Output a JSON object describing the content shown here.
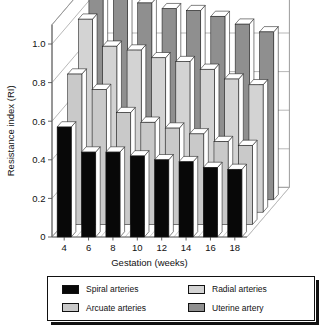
{
  "chart_data": {
    "type": "bar",
    "subtype": "3d-grouped-bar",
    "title": "",
    "xlabel": "Gestation (weeks)",
    "ylabel": "Resistance index (RI)",
    "categories": [
      "4",
      "6",
      "8",
      "10",
      "12",
      "14",
      "16",
      "18"
    ],
    "ylim": [
      0,
      1.1
    ],
    "yticks": [
      "0",
      "0.2",
      "0.4",
      "0.6",
      "0.8",
      "1.0"
    ],
    "ytick_values": [
      0,
      0.2,
      0.4,
      0.6,
      0.8,
      1.0
    ],
    "grid": true,
    "legend_position": "bottom",
    "series": [
      {
        "name": "Spiral arteries",
        "color": "#080808",
        "values": [
          0.57,
          0.44,
          0.44,
          0.42,
          0.4,
          0.39,
          0.36,
          0.35
        ]
      },
      {
        "name": "Arcuate arteries",
        "color": "#c9c9c9",
        "values": [
          0.78,
          0.7,
          0.58,
          0.53,
          0.5,
          0.47,
          0.43,
          0.41
        ]
      },
      {
        "name": "Radial arteries",
        "color": "#d3d3d3",
        "values": [
          1.0,
          0.86,
          0.84,
          0.8,
          0.78,
          0.74,
          0.69,
          0.66
        ]
      },
      {
        "name": "Uterine artery",
        "color": "#8f8f8f",
        "values": [
          1.09,
          1.06,
          1.02,
          0.99,
          0.98,
          0.95,
          0.91,
          0.87
        ]
      }
    ]
  },
  "legend": {
    "items": [
      {
        "label": "Spiral arteries",
        "color": "#080808"
      },
      {
        "label": "Radial arteries",
        "color": "#d3d3d3"
      },
      {
        "label": "Arcuate arteries",
        "color": "#c9c9c9"
      },
      {
        "label": "Uterine artery",
        "color": "#8f8f8f"
      }
    ]
  }
}
